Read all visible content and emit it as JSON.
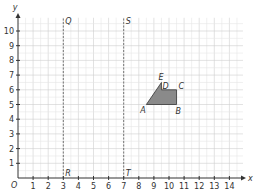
{
  "chart_data": {
    "type": "coordinate-grid",
    "xlabel": "x",
    "ylabel": "y",
    "origin_label": "O",
    "xlim": [
      0,
      14
    ],
    "ylim": [
      0,
      10
    ],
    "x_ticks": [
      "1",
      "2",
      "3",
      "4",
      "5",
      "6",
      "7",
      "8",
      "9",
      "10",
      "11",
      "12",
      "13",
      "14"
    ],
    "y_ticks": [
      "1",
      "2",
      "3",
      "4",
      "5",
      "6",
      "7",
      "8",
      "9",
      "10"
    ],
    "grid": true,
    "dashed_lines": [
      {
        "x": 3,
        "top_label": "Q",
        "bottom_label": "R"
      },
      {
        "x": 7,
        "top_label": "S",
        "bottom_label": "T"
      }
    ],
    "shape": {
      "fill": "#8a8a8a",
      "vertices": [
        {
          "label": "A",
          "x": 8.5,
          "y": 5
        },
        {
          "label": "E",
          "x": 9.5,
          "y": 6.5
        },
        {
          "label": "D",
          "x": 9.5,
          "y": 6
        },
        {
          "label": "C",
          "x": 10.5,
          "y": 6
        },
        {
          "label": "B",
          "x": 10.5,
          "y": 5
        }
      ]
    }
  }
}
